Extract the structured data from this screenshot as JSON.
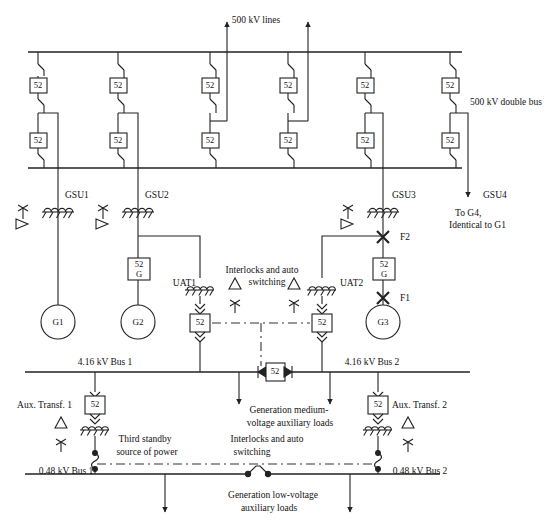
{
  "diagram": {
    "type": "electrical-single-line-diagram",
    "title_visible": false,
    "line_color": "#222222",
    "dashdot_color": "#333333",
    "bus_color": "#111111"
  },
  "labels": {
    "hv_lines": "500 kV lines",
    "double_bus": "500 kV double bus",
    "gsu1": "GSU1",
    "gsu2": "GSU2",
    "gsu3": "GSU3",
    "gsu4": "GSU4",
    "to_g4_line1": "To G4,",
    "to_g4_line2": "Identical to G1",
    "uat1": "UAT1",
    "uat2": "UAT2",
    "interlocks_mv_line1": "Interlocks and auto",
    "interlocks_mv_line2": "switching",
    "interlocks_lv_line1": "Interlocks and auto",
    "interlocks_lv_line2": "switching",
    "gen1": "G1",
    "gen2": "G2",
    "gen3": "G3",
    "fault1": "F1",
    "fault2": "F2",
    "bus_mv_1": "4.16 kV Bus 1",
    "bus_mv_2": "4.16 kV Bus 2",
    "bus_lv_1": "0.48 kV Bus 1",
    "bus_lv_2": "0.48 kV Bus 2",
    "aux_transf_1": "Aux. Transf. 1",
    "aux_transf_2": "Aux. Transf. 2",
    "third_standby_line1": "Third standby",
    "third_standby_line2": "source of power",
    "mv_loads_line1": "Generation medium-",
    "mv_loads_line2": "voltage auxiliary loads",
    "lv_loads_line1": "Generation low-voltage",
    "lv_loads_line2": "auxiliary loads"
  },
  "devices": {
    "breaker_code": "52",
    "generator_breaker_code_top": "52",
    "generator_breaker_code_bottom": "G"
  },
  "hv_breakers": {
    "count": 6,
    "x_positions": [
      38,
      118,
      210,
      288,
      365,
      450
    ],
    "upper_row_y": 85,
    "lower_row_y": 141,
    "bus_top_y": 52,
    "bus_bottom_y": 168,
    "bypass_offsets": [
      20,
      20,
      20,
      20,
      20,
      20
    ]
  },
  "hv_line_feeders": {
    "x_positions": [
      227,
      308
    ],
    "arrow_tip_y": 22
  },
  "gsu_units": [
    {
      "name": "GSU1",
      "x": 58,
      "transformer_y": 212,
      "generator": "G1",
      "generator_y": 322
    },
    {
      "name": "GSU2",
      "x": 138,
      "transformer_y": 212,
      "generator": "G2",
      "generator_y": 322
    },
    {
      "name": "GSU3",
      "x": 383,
      "transformer_y": 212,
      "generator": "G3",
      "generator_y": 322
    },
    {
      "name": "GSU4",
      "x": 468,
      "transformer_y": 212,
      "generator": "G4",
      "generator_y": 0
    }
  ],
  "uat_units": [
    {
      "name": "UAT1",
      "x": 200,
      "transformer_y": 290,
      "breaker_y": 325
    },
    {
      "name": "UAT2",
      "x": 322,
      "transformer_y": 290,
      "breaker_y": 325
    }
  ],
  "buses": {
    "mv_bus_1": {
      "label": "4.16 kV Bus 1",
      "y": 372,
      "x1": 25,
      "x2": 258
    },
    "mv_bus_2": {
      "label": "4.16 kV Bus 2",
      "y": 372,
      "x1": 290,
      "x2": 470
    },
    "lv_bus_1": {
      "label": "0.48 kV Bus 1",
      "y": 474,
      "x1": 25,
      "x2": 265
    },
    "lv_bus_2": {
      "label": "0.48 kV Bus 2",
      "y": 474,
      "x1": 265,
      "x2": 440
    },
    "tie_breaker_mv": {
      "code": "52",
      "x": 274,
      "y": 372
    }
  },
  "aux_transformers": [
    {
      "name": "Aux. Transf. 1",
      "x": 95,
      "breaker_y": 404,
      "transformer_y": 428
    },
    {
      "name": "Aux. Transf. 2",
      "x": 378,
      "breaker_y": 404,
      "transformer_y": 428
    }
  ],
  "load_arrows": {
    "mv_loads_x": [
      239,
      330
    ],
    "mv_arrow_tip_y": 404,
    "lv_loads_x": [
      165,
      350
    ],
    "lv_arrow_tip_y": 512
  },
  "fault_markers": [
    {
      "name": "F2",
      "x": 383,
      "y": 237
    },
    {
      "name": "F1",
      "x": 383,
      "y": 298
    }
  ],
  "dashdot_links": [
    {
      "name": "mv-interlock-link",
      "y": 325,
      "x1": 212,
      "x2": 310
    },
    {
      "name": "mv-interlock-vertical",
      "x": 261,
      "y1": 325,
      "y2": 366
    },
    {
      "name": "lv-interlock-link",
      "y": 464,
      "x1": 97,
      "x2": 376
    }
  ]
}
